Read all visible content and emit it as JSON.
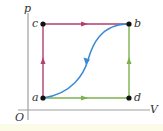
{
  "diagram": {
    "type": "pV-diagram",
    "axes": {
      "y_label": "p",
      "x_label": "V",
      "origin_label": "O"
    },
    "points": [
      {
        "id": "a",
        "label": "a"
      },
      {
        "id": "b",
        "label": "b"
      },
      {
        "id": "c",
        "label": "c"
      },
      {
        "id": "d",
        "label": "d"
      }
    ],
    "paths": [
      {
        "from": "a",
        "to": "c",
        "color": "#b0406f",
        "style": "straight"
      },
      {
        "from": "c",
        "to": "b",
        "color": "#b0406f",
        "style": "straight"
      },
      {
        "from": "a",
        "to": "d",
        "color": "#6cb04a",
        "style": "straight"
      },
      {
        "from": "d",
        "to": "b",
        "color": "#6cb04a",
        "style": "straight"
      },
      {
        "from": "b",
        "to": "a",
        "color": "#3a8ad6",
        "style": "curve"
      }
    ],
    "colors": {
      "axis": "#999999",
      "acb": "#b0406f",
      "adb": "#6cb04a",
      "ba_curve": "#3a8ad6",
      "point": "#111111"
    }
  }
}
